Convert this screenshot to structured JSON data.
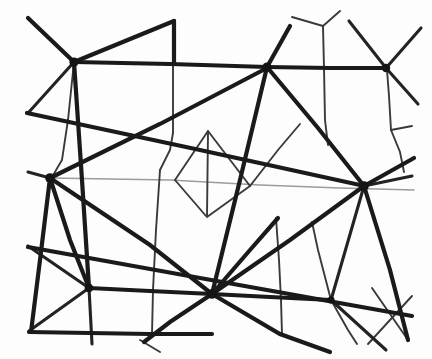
{
  "figure": {
    "title": "Irregular line network diagram",
    "background_color": "#fdfdfd",
    "width": 432,
    "height": 359,
    "ink_color": "#1a1a1a",
    "faint_ink_color": "#9c9c9c"
  },
  "chart_data": {
    "type": "diagram",
    "title": "Irregular line network diagram",
    "nodes": [
      {
        "id": "n-top-left",
        "label": "top-left hub",
        "x": 74,
        "y": 62,
        "degree": 6,
        "weight": "thick"
      },
      {
        "id": "n-top-mid",
        "label": "top-middle hub",
        "x": 267,
        "y": 67,
        "degree": 6,
        "weight": "thick"
      },
      {
        "id": "n-top-right",
        "label": "top-right hub",
        "x": 386,
        "y": 68,
        "degree": 5,
        "weight": "thick"
      },
      {
        "id": "n-left-hub",
        "label": "left-center hub",
        "x": 50,
        "y": 178,
        "degree": 7,
        "weight": "thick"
      },
      {
        "id": "n-right-hub",
        "label": "right-center hub",
        "x": 364,
        "y": 186,
        "degree": 7,
        "weight": "thick"
      },
      {
        "id": "n-bottom-left",
        "label": "bottom-left hub",
        "x": 89,
        "y": 288,
        "degree": 6,
        "weight": "thick"
      },
      {
        "id": "n-bottom-mid",
        "label": "bottom-middle hub",
        "x": 212,
        "y": 294,
        "degree": 7,
        "weight": "thick"
      },
      {
        "id": "n-bottom-right",
        "label": "bottom-right node",
        "x": 331,
        "y": 300,
        "degree": 4,
        "weight": "medium"
      },
      {
        "id": "n-kite-apex",
        "label": "kite apex",
        "x": 208,
        "y": 131,
        "degree": 3,
        "weight": "thin"
      },
      {
        "id": "n-kite-base",
        "label": "kite base",
        "x": 206,
        "y": 216,
        "degree": 3,
        "weight": "thin"
      },
      {
        "id": "n-y-junction",
        "label": "top y-junction",
        "x": 323,
        "y": 26,
        "degree": 3,
        "weight": "thin"
      },
      {
        "id": "n-right-branch",
        "label": "right branch node",
        "x": 391,
        "y": 130,
        "degree": 3,
        "weight": "thin"
      }
    ],
    "edges": [
      {
        "from": "n-top-left",
        "to": "n-top-mid",
        "weight": "thick"
      },
      {
        "from": "n-top-mid",
        "to": "n-top-right",
        "weight": "thick"
      },
      {
        "from": "n-top-left",
        "to": "n-left-hub",
        "weight": "medium"
      },
      {
        "from": "n-left-hub",
        "to": "n-right-hub",
        "weight": "faint"
      },
      {
        "from": "n-left-hub",
        "to": "n-bottom-left",
        "weight": "thick"
      },
      {
        "from": "n-bottom-left",
        "to": "n-bottom-mid",
        "weight": "thick"
      },
      {
        "from": "n-bottom-mid",
        "to": "n-bottom-right",
        "weight": "thick"
      },
      {
        "from": "n-bottom-mid",
        "to": "n-right-hub",
        "weight": "thick"
      },
      {
        "from": "n-top-mid",
        "to": "n-bottom-mid",
        "weight": "thick"
      },
      {
        "from": "n-top-mid",
        "to": "n-right-hub",
        "weight": "thick"
      },
      {
        "from": "n-left-hub",
        "to": "n-top-mid",
        "weight": "thick"
      },
      {
        "from": "n-right-hub",
        "to": "n-bottom-right",
        "weight": "medium"
      },
      {
        "from": "n-kite-apex",
        "to": "n-kite-base",
        "weight": "thin"
      },
      {
        "from": "n-y-junction",
        "to": "n-top-mid",
        "weight": "thin"
      },
      {
        "from": "n-right-branch",
        "to": "n-top-right",
        "weight": "thin"
      }
    ],
    "faint_line": {
      "label": "faint horizontal spanning line",
      "from": {
        "x": 50,
        "y": 178
      },
      "to": {
        "x": 414,
        "y": 189
      },
      "color": "#9c9c9c"
    },
    "node_count": 12,
    "edge_count": 15,
    "legend": [],
    "grid": false
  }
}
